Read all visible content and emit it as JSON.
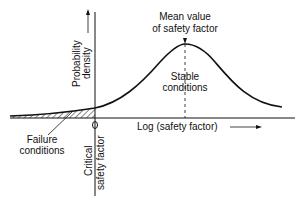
{
  "diagram": {
    "y_axis_label": [
      "Probability",
      "density"
    ],
    "x_axis_label": "Log (safety factor)",
    "mean_label": [
      "Mean value",
      "of safety factor"
    ],
    "stable_label": [
      "Stable",
      "conditions"
    ],
    "failure_label": [
      "Failure",
      "conditions"
    ],
    "critical_label": [
      "Critical",
      "safety factor"
    ],
    "colors": {
      "ink": "#111111",
      "background": "#ffffff"
    }
  }
}
